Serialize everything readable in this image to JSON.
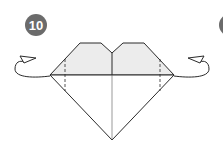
{
  "step": {
    "number": "10",
    "badge_color": "#6b6b6b"
  },
  "next_step_badge": {
    "partial": true,
    "color": "#6b6b6b"
  },
  "diagram": {
    "paper_fill": "#ececec",
    "line_color": "#2a2a2a",
    "instruction_arrows": [
      {
        "side": "left",
        "icon": "fold-behind-arrow-icon"
      },
      {
        "side": "right",
        "icon": "fold-behind-arrow-icon"
      }
    ],
    "crease_lines": [
      "left-dashed-crease",
      "right-dashed-crease",
      "center-crease",
      "horizontal-crease"
    ]
  }
}
